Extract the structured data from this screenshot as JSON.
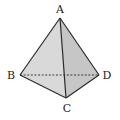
{
  "diagram": {
    "type": "tetrahedron",
    "vertices": [
      {
        "label": "A",
        "x": 60,
        "y": 18,
        "lx": 60,
        "ly": 13
      },
      {
        "label": "B",
        "x": 20,
        "y": 75,
        "lx": 11,
        "ly": 79
      },
      {
        "label": "C",
        "x": 66,
        "y": 98,
        "lx": 67,
        "ly": 112
      },
      {
        "label": "D",
        "x": 99,
        "y": 75,
        "lx": 107,
        "ly": 79
      }
    ],
    "edges": [
      {
        "from": "A",
        "to": "B",
        "style": "solid"
      },
      {
        "from": "A",
        "to": "C",
        "style": "solid"
      },
      {
        "from": "A",
        "to": "D",
        "style": "solid"
      },
      {
        "from": "B",
        "to": "C",
        "style": "solid"
      },
      {
        "from": "C",
        "to": "D",
        "style": "solid"
      },
      {
        "from": "B",
        "to": "D",
        "style": "dashed"
      }
    ],
    "colors": {
      "face_left": "#d9d9d9",
      "face_right": "#c6c6c6",
      "edge": "#2a2a2a"
    }
  }
}
